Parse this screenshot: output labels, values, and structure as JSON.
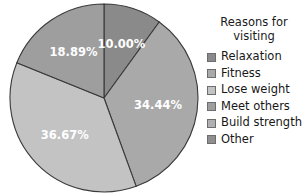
{
  "chart_data": {
    "type": "pie",
    "title": "",
    "legend_title": "Reasons for visiting",
    "legend_title_lines": [
      "Reasons for",
      "visiting"
    ],
    "legend_position": "right",
    "grid": false,
    "start_angle_deg": 0,
    "direction": "clockwise",
    "categories": [
      "Relaxation",
      "Fitness",
      "Lose weight",
      "Meet others",
      "Build strength",
      "Other"
    ],
    "values": [
      10.0,
      34.44,
      36.67,
      18.89,
      0,
      0
    ],
    "labels": [
      "10.00%",
      "34.44%",
      "36.67%",
      "18.89%",
      "",
      ""
    ],
    "colors": [
      "#8a8a8a",
      "#a9a9a9",
      "#c3c3c3",
      "#9e9e9e",
      "#b0b0b0",
      "#8f8f8f"
    ],
    "slices": [
      {
        "name": "Relaxation",
        "value": 10.0,
        "label": "10.00%",
        "color": "#8a8a8a",
        "visible": true
      },
      {
        "name": "Fitness",
        "value": 34.44,
        "label": "34.44%",
        "color": "#a9a9a9",
        "visible": true
      },
      {
        "name": "Lose weight",
        "value": 36.67,
        "label": "36.67%",
        "color": "#c3c3c3",
        "visible": true
      },
      {
        "name": "Meet others",
        "value": 18.89,
        "label": "18.89%",
        "color": "#9e9e9e",
        "visible": true
      },
      {
        "name": "Build strength",
        "value": 0,
        "label": "",
        "color": "#b0b0b0",
        "visible": false
      },
      {
        "name": "Other",
        "value": 0,
        "label": "",
        "color": "#8f8f8f",
        "visible": false
      }
    ]
  },
  "pie": {
    "label_1": "10.00%",
    "label_2": "34.44%",
    "label_3": "36.67%",
    "label_4": "18.89%"
  },
  "legend": {
    "title_line_1": "Reasons for",
    "title_line_2": "visiting",
    "items": [
      {
        "label": "Relaxation",
        "color": "#8a8a8a"
      },
      {
        "label": "Fitness",
        "color": "#a9a9a9"
      },
      {
        "label": "Lose weight",
        "color": "#c3c3c3"
      },
      {
        "label": "Meet others",
        "color": "#9e9e9e"
      },
      {
        "label": "Build strength",
        "color": "#b0b0b0"
      },
      {
        "label": "Other",
        "color": "#8f8f8f"
      }
    ]
  }
}
